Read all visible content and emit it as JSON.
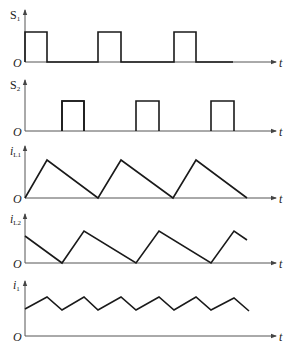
{
  "figure": {
    "panels": [
      {
        "id": "S1",
        "label_main": "S",
        "label_sub": "1",
        "italic": false,
        "origin": "O",
        "axis": "t"
      },
      {
        "id": "S2",
        "label_main": "S",
        "label_sub": "2",
        "italic": false,
        "origin": "O",
        "axis": "t"
      },
      {
        "id": "iL1",
        "label_main": "i",
        "label_sub": "L1",
        "italic": true,
        "origin": "O",
        "axis": "t"
      },
      {
        "id": "iL2",
        "label_main": "i",
        "label_sub": "L2",
        "italic": true,
        "origin": "O",
        "axis": "t"
      },
      {
        "id": "i1",
        "label_main": "i",
        "label_sub": "1",
        "italic": true,
        "origin": "O",
        "axis": "t"
      }
    ],
    "colors": {
      "wave": "#1a1a1a",
      "axis": "#555555",
      "background": "#ffffff"
    }
  },
  "waveforms": {
    "S1": {
      "type": "pulse",
      "pulses": [
        [
          0,
          0.3
        ],
        [
          1,
          1.3
        ],
        [
          2,
          2.3
        ]
      ],
      "period": 1,
      "duty": 0.3
    },
    "S2": {
      "type": "pulse",
      "pulses": [
        [
          0.5,
          0.8
        ],
        [
          1.5,
          1.8
        ],
        [
          2.5,
          2.8
        ]
      ],
      "period": 1,
      "duty": 0.3,
      "phase_shift": 0.5
    },
    "iL1": {
      "type": "triangle",
      "rise_while": "S1 on",
      "min": 0,
      "start": 0
    },
    "iL2": {
      "type": "triangle",
      "rise_while": "S2 on",
      "min": 0,
      "start": "mid-fall"
    },
    "i1": {
      "type": "ripple",
      "description": "sum of iL1 and iL2, ripple at twice switching frequency",
      "dc_offset": "positive"
    }
  }
}
